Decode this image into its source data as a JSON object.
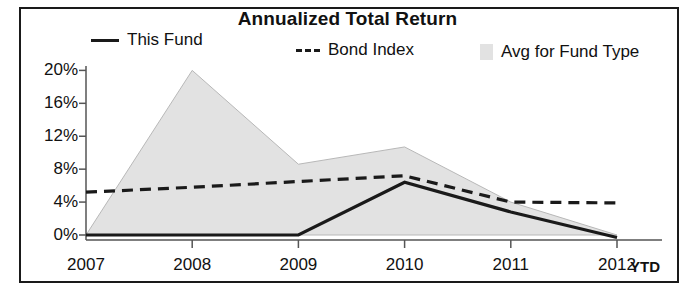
{
  "chart_data": {
    "type": "area",
    "title": "Annualized Total Return",
    "xlabel": "",
    "ylabel": "",
    "categories": [
      "2007",
      "2008",
      "2009",
      "2010",
      "2011",
      "2012"
    ],
    "x_axis_suffix_label": "YTD",
    "ylim": [
      0,
      20
    ],
    "yticks": [
      0,
      4,
      8,
      12,
      16,
      20
    ],
    "ytick_labels": [
      "0%",
      "4%",
      "8%",
      "12%",
      "16%",
      "20%"
    ],
    "grid": false,
    "legend_position": "top",
    "series": [
      {
        "name": "This Fund",
        "marker": "solid-line",
        "color": "#1a1a1a",
        "values": [
          0.0,
          0.0,
          0.0,
          6.4,
          2.8,
          -0.3
        ]
      },
      {
        "name": "Bond Index",
        "marker": "dashed-line",
        "color": "#1a1a1a",
        "values": [
          5.2,
          5.8,
          6.5,
          7.2,
          4.0,
          3.9
        ]
      },
      {
        "name": "Avg for Fund Type",
        "marker": "filled-area",
        "color": "#e2e2e2",
        "values": [
          0.0,
          20.0,
          8.6,
          10.7,
          4.0,
          0.0
        ]
      }
    ]
  },
  "legend": {
    "items": [
      {
        "label": "This Fund",
        "marker": "solid-line"
      },
      {
        "label": "Bond Index",
        "marker": "dashed-line"
      },
      {
        "label": "Avg for Fund Type",
        "marker": "filled-area"
      }
    ]
  },
  "colors": {
    "axis": "#555555",
    "line": "#1a1a1a",
    "area_fill": "#e2e2e2",
    "area_stroke": "#b8b8b8",
    "border": "#1a1a1a",
    "text": "#111111"
  }
}
